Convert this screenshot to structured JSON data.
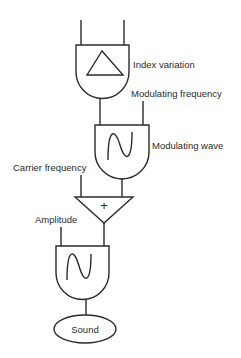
{
  "diagram": {
    "type": "FM synthesis unit-generator patch",
    "labels": {
      "index_variation": "Index variation",
      "modulating_frequency": "Modulating frequency",
      "modulating_wave": "Modulating wave",
      "carrier_frequency": "Carrier frequency",
      "amplitude": "Amplitude",
      "sound": "Sound"
    },
    "nodes": [
      {
        "id": "envelope",
        "kind": "oscillator",
        "waveform": "triangle-icon",
        "label": "Index variation"
      },
      {
        "id": "modulator",
        "kind": "oscillator",
        "waveform": "sine-icon",
        "label": "Modulating wave"
      },
      {
        "id": "adder",
        "kind": "adder",
        "symbol": "+"
      },
      {
        "id": "carrier",
        "kind": "oscillator",
        "waveform": "sine-icon"
      },
      {
        "id": "output",
        "kind": "output",
        "label": "Sound"
      }
    ],
    "edges": [
      {
        "from": "envelope",
        "to": "modulator",
        "input": "amplitude"
      },
      {
        "from": "Modulating frequency",
        "to": "modulator",
        "input": "frequency"
      },
      {
        "from": "modulator",
        "to": "adder"
      },
      {
        "from": "Carrier frequency",
        "to": "adder"
      },
      {
        "from": "Amplitude",
        "to": "carrier",
        "input": "amplitude"
      },
      {
        "from": "adder",
        "to": "carrier",
        "input": "frequency"
      },
      {
        "from": "carrier",
        "to": "output"
      }
    ],
    "adder_symbol": "+",
    "colors": {
      "ink": "#2a2a2a",
      "background": "#ffffff"
    }
  }
}
